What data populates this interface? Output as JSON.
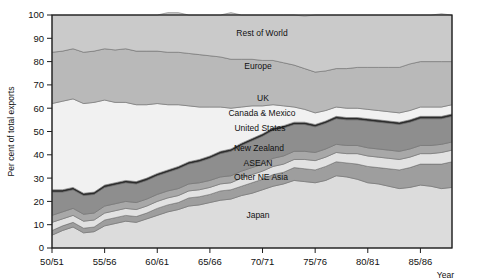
{
  "chart_data": {
    "type": "area",
    "title": "",
    "xlabel": "Year",
    "ylabel": "Per cent of total exports",
    "ylim": [
      0,
      100
    ],
    "yticks": [
      0,
      10,
      20,
      30,
      40,
      50,
      60,
      70,
      80,
      90,
      100
    ],
    "xticks": [
      "50/51",
      "55/56",
      "60/61",
      "65/66",
      "70/71",
      "75/76",
      "80/81",
      "85/86"
    ],
    "xtick_years": [
      1950,
      1955,
      1960,
      1965,
      1970,
      1975,
      1980,
      1985
    ],
    "x_range": [
      1950,
      1988
    ],
    "grid": false,
    "legend": "inline-labels",
    "stacked": true,
    "x": [
      1950,
      1951,
      1952,
      1953,
      1954,
      1955,
      1956,
      1957,
      1958,
      1959,
      1960,
      1961,
      1962,
      1963,
      1964,
      1965,
      1966,
      1967,
      1968,
      1969,
      1970,
      1971,
      1972,
      1973,
      1974,
      1975,
      1976,
      1977,
      1978,
      1979,
      1980,
      1981,
      1982,
      1983,
      1984,
      1985,
      1986,
      1987,
      1988
    ],
    "series": [
      {
        "name": "Japan",
        "color": "#dcdcdc",
        "values": [
          5.5,
          7.5,
          9.0,
          6.5,
          7.0,
          9.5,
          10.5,
          11.5,
          11.0,
          12.5,
          14.0,
          15.5,
          16.5,
          18.0,
          18.5,
          19.5,
          20.5,
          21.0,
          22.5,
          23.5,
          25.0,
          26.5,
          27.5,
          29.0,
          28.5,
          28.0,
          29.0,
          31.0,
          30.5,
          29.5,
          28.0,
          27.5,
          26.5,
          25.5,
          26.0,
          27.0,
          26.5,
          25.5,
          26.0
        ]
      },
      {
        "name": "Other NE Asia",
        "color": "#9e9e9e",
        "values": [
          2.0,
          2.0,
          2.0,
          2.0,
          2.0,
          2.5,
          2.5,
          2.5,
          2.5,
          2.5,
          3.0,
          3.0,
          3.0,
          3.5,
          3.5,
          3.5,
          4.0,
          4.0,
          4.0,
          4.5,
          4.5,
          5.0,
          5.0,
          5.5,
          5.5,
          5.5,
          6.0,
          6.0,
          6.0,
          6.5,
          7.0,
          7.0,
          7.5,
          8.0,
          8.5,
          9.0,
          9.5,
          10.5,
          11.0
        ]
      },
      {
        "name": "ASEAN",
        "color": "#e2e2e2",
        "values": [
          3.5,
          3.0,
          3.0,
          3.0,
          3.0,
          3.0,
          3.0,
          3.0,
          3.0,
          3.0,
          3.0,
          3.0,
          3.0,
          3.0,
          3.0,
          3.0,
          3.0,
          3.0,
          3.5,
          3.5,
          3.5,
          3.5,
          3.5,
          3.5,
          4.0,
          4.0,
          4.0,
          4.0,
          4.0,
          4.5,
          4.5,
          4.5,
          4.5,
          4.5,
          4.5,
          4.5,
          4.5,
          5.0,
          5.0
        ]
      },
      {
        "name": "New Zealand",
        "color": "#a8a8a8",
        "values": [
          3.0,
          3.0,
          3.0,
          3.0,
          3.0,
          3.0,
          3.0,
          3.0,
          3.0,
          3.0,
          3.0,
          3.0,
          3.0,
          3.0,
          3.0,
          3.0,
          3.0,
          3.0,
          3.0,
          3.0,
          3.0,
          3.5,
          3.5,
          3.5,
          3.5,
          3.5,
          3.5,
          3.5,
          3.5,
          3.5,
          3.5,
          3.5,
          3.5,
          3.5,
          3.5,
          3.5,
          3.5,
          3.5,
          3.5
        ]
      },
      {
        "name": "United States",
        "color": "#8e8e8e",
        "values": [
          10.0,
          8.5,
          8.0,
          8.0,
          8.0,
          8.0,
          8.0,
          8.0,
          8.0,
          8.0,
          8.0,
          8.0,
          8.5,
          8.5,
          9.0,
          9.5,
          10.0,
          10.5,
          11.0,
          11.5,
          12.0,
          12.0,
          12.0,
          11.5,
          11.5,
          11.0,
          11.0,
          11.0,
          11.0,
          11.0,
          11.5,
          11.5,
          11.5,
          11.5,
          11.5,
          11.5,
          11.5,
          11.0,
          11.0
        ]
      },
      {
        "name": "Canada & Mexico",
        "color": "#2b2b2b",
        "values": [
          1.0,
          1.0,
          1.0,
          1.0,
          1.0,
          1.0,
          1.0,
          1.0,
          1.0,
          1.0,
          1.0,
          1.0,
          1.0,
          1.0,
          1.0,
          1.0,
          1.0,
          1.0,
          1.0,
          1.0,
          1.0,
          1.0,
          1.0,
          1.0,
          1.0,
          1.0,
          1.0,
          1.0,
          1.0,
          1.0,
          1.0,
          1.0,
          1.0,
          1.0,
          1.0,
          1.0,
          1.0,
          1.0,
          1.0
        ]
      },
      {
        "name": "UK",
        "color": "#f1f1f1",
        "values": [
          37.0,
          38.0,
          38.0,
          38.5,
          38.5,
          36.5,
          34.5,
          33.5,
          33.0,
          31.5,
          30.0,
          28.0,
          26.5,
          24.0,
          22.5,
          21.0,
          19.0,
          17.5,
          15.5,
          14.0,
          12.0,
          10.0,
          8.5,
          6.5,
          5.5,
          5.0,
          4.5,
          4.0,
          4.0,
          4.0,
          4.0,
          4.0,
          4.0,
          4.0,
          4.0,
          4.0,
          4.0,
          4.0,
          4.0
        ]
      },
      {
        "name": "Europe",
        "color": "#b9b9b9",
        "values": [
          22.0,
          21.5,
          21.5,
          22.0,
          22.0,
          22.0,
          22.5,
          23.0,
          23.0,
          23.0,
          22.5,
          22.5,
          22.5,
          22.5,
          22.5,
          22.0,
          21.5,
          21.0,
          20.5,
          20.0,
          19.5,
          19.0,
          18.5,
          18.0,
          17.5,
          17.5,
          17.0,
          16.5,
          17.0,
          17.5,
          18.0,
          18.5,
          19.0,
          19.5,
          20.0,
          19.5,
          19.5,
          19.5,
          18.5
        ]
      },
      {
        "name": "Rest of World",
        "color": "#cacaca",
        "values": [
          16.0,
          15.5,
          14.5,
          16.0,
          15.5,
          14.5,
          15.0,
          14.5,
          15.5,
          15.5,
          15.5,
          17.0,
          17.0,
          16.5,
          17.0,
          17.5,
          18.0,
          20.0,
          19.0,
          19.0,
          19.5,
          19.5,
          20.5,
          21.5,
          22.5,
          24.5,
          24.0,
          23.0,
          23.0,
          22.5,
          22.5,
          22.5,
          22.5,
          22.5,
          21.0,
          20.0,
          20.0,
          20.5,
          20.0
        ]
      }
    ],
    "series_label_positions": [
      {
        "name": "Rest of World",
        "label": "Rest of World",
        "x_px": 262,
        "y_px": 36
      },
      {
        "name": "Europe",
        "label": "Europe",
        "x_px": 258,
        "y_px": 69
      },
      {
        "name": "UK",
        "label": "UK",
        "x_px": 263,
        "y_px": 101
      },
      {
        "name": "Canada & Mexico",
        "label": "Canada & Mexico",
        "x_px": 262,
        "y_px": 116
      },
      {
        "name": "United States",
        "label": "United States",
        "x_px": 260,
        "y_px": 131
      },
      {
        "name": "New Zealand",
        "label": "New Zealand",
        "x_px": 259,
        "y_px": 151
      },
      {
        "name": "ASEAN",
        "label": "ASEAN",
        "x_px": 258,
        "y_px": 166
      },
      {
        "name": "Other NE Asia",
        "label": "Other NE Asia",
        "x_px": 261,
        "y_px": 180
      },
      {
        "name": "Japan",
        "label": "Japan",
        "x_px": 258,
        "y_px": 218
      }
    ]
  },
  "axes": {
    "y_label": "Per cent of total exports",
    "x_label": "Year",
    "y_ticks": [
      "100",
      "90",
      "80",
      "70",
      "60",
      "50",
      "40",
      "30",
      "20",
      "10",
      "0"
    ],
    "x_ticks": [
      "50/51",
      "55/56",
      "60/61",
      "65/66",
      "70/71",
      "75/76",
      "80/81",
      "85/86"
    ]
  },
  "colors": {
    "frame": "#1d1d1d",
    "text": "#111111",
    "background": "#ffffff"
  }
}
